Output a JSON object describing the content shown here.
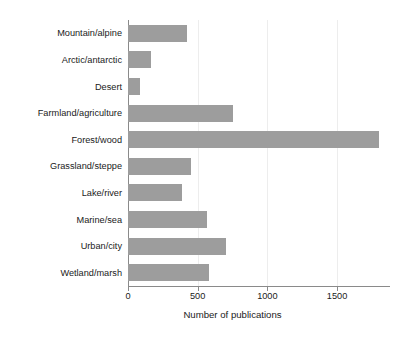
{
  "chart_data": {
    "type": "bar",
    "orientation": "horizontal",
    "title": "",
    "xlabel": "Number of publications",
    "ylabel": "",
    "categories": [
      "Mountain/alpine",
      "Arctic/antarctic",
      "Desert",
      "Farmland/agriculture",
      "Forest/wood",
      "Grassland/steppe",
      "Lake/river",
      "Marine/sea",
      "Urban/city",
      "Wetland/marsh"
    ],
    "values": [
      420,
      165,
      85,
      750,
      1800,
      450,
      385,
      570,
      700,
      580
    ],
    "xlim": [
      0,
      1880
    ],
    "ylim": [
      0,
      10
    ],
    "xticks": [
      0,
      500,
      1000,
      1500
    ],
    "xticklabels": [
      "0",
      "500",
      "1000",
      "1500"
    ],
    "grid": "vertical",
    "legend": "none",
    "bar_color": "#9d9d9d",
    "axis_color": "#8a8a8a",
    "gridline_color": "#ededed",
    "background": "#ffffff"
  }
}
